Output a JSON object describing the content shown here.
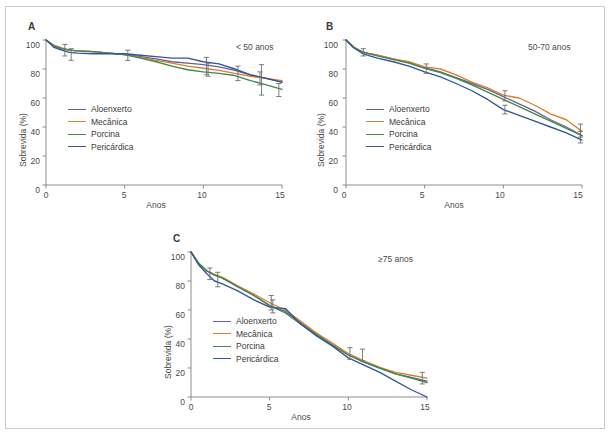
{
  "figure": {
    "panels": [
      {
        "letter": "A",
        "subtitle": "< 50 anos",
        "xlabel": "Anos",
        "ylabel": "Sobrevida (%)"
      },
      {
        "letter": "B",
        "subtitle": "50-70 anos",
        "xlabel": "Anos",
        "ylabel": "Sobrevida (%)"
      },
      {
        "letter": "C",
        "subtitle": "≥75 anos",
        "xlabel": "Anos",
        "ylabel": "Sobrevida (%)"
      }
    ],
    "legend_labels": [
      "Aloenxerto",
      "Mecânica",
      "Porcina",
      "Pericárdica"
    ],
    "colors": {
      "aloenxerto": "#6b5f93",
      "mecanica": "#d9802f",
      "porcina": "#3f8a4c",
      "pericardica": "#34549b",
      "axis": "#8d8d8d",
      "error_bar": "#6d6d6d",
      "text": "#3a3a3a",
      "frame": "#c9c9c9"
    },
    "y_ticks": [
      "0",
      "20",
      "40",
      "60",
      "80",
      "100"
    ],
    "x_ticks": [
      "0",
      "5",
      "10",
      "15"
    ]
  },
  "chart_data": [
    {
      "type": "line",
      "panel": "A",
      "title": "< 50 anos",
      "xlabel": "Anos",
      "ylabel": "Sobrevida (%)",
      "xlim": [
        0,
        15
      ],
      "ylim": [
        0,
        100
      ],
      "x_ticks": [
        0,
        5,
        10,
        15
      ],
      "y_ticks": [
        0,
        20,
        40,
        60,
        80,
        100
      ],
      "grid": false,
      "legend_position": "center-left",
      "x": [
        0,
        0.5,
        1,
        1.5,
        2,
        3,
        4,
        5,
        6,
        7,
        8,
        9,
        10,
        11,
        12,
        13,
        14,
        15
      ],
      "series": [
        {
          "name": "Aloenxerto",
          "color": "#6b5f93",
          "values": [
            100,
            96,
            94,
            93,
            92.5,
            92,
            91,
            90,
            88.5,
            87,
            85,
            84,
            83,
            81.5,
            79,
            76,
            73.5,
            71
          ]
        },
        {
          "name": "Mecânica",
          "color": "#d9802f",
          "values": [
            100,
            96.5,
            94.5,
            93,
            92.5,
            92,
            91,
            90,
            88,
            86,
            84,
            82,
            80.5,
            79,
            77,
            75,
            73.5,
            72
          ]
        },
        {
          "name": "Porcina",
          "color": "#3f8a4c",
          "values": [
            100,
            96,
            94,
            93,
            92.5,
            92,
            91,
            90,
            87.5,
            85,
            82,
            79.5,
            78,
            77,
            75.5,
            72,
            69,
            66
          ]
        },
        {
          "name": "Pericárdica",
          "color": "#34549b",
          "values": [
            100,
            95,
            93,
            91.5,
            91,
            90.5,
            90.5,
            90.5,
            89.5,
            88.5,
            87.5,
            87.5,
            85,
            83.5,
            80,
            76,
            73.5,
            71
          ]
        }
      ],
      "error_bars": [
        {
          "x": 1.2,
          "y": 94,
          "lower": 89,
          "upper": 97
        },
        {
          "x": 1.6,
          "y": 91,
          "lower": 86,
          "upper": 94
        },
        {
          "x": 5.2,
          "y": 90,
          "lower": 86,
          "upper": 93
        },
        {
          "x": 10.2,
          "y": 82,
          "lower": 76,
          "upper": 88
        },
        {
          "x": 10.3,
          "y": 79,
          "lower": 75,
          "upper": 84
        },
        {
          "x": 12.2,
          "y": 77,
          "lower": 72,
          "upper": 82
        },
        {
          "x": 13.6,
          "y": 73,
          "lower": 69,
          "upper": 78
        },
        {
          "x": 13.7,
          "y": 70,
          "lower": 62,
          "upper": 83
        },
        {
          "x": 14.8,
          "y": 65,
          "lower": 61,
          "upper": 70
        }
      ]
    },
    {
      "type": "line",
      "panel": "B",
      "title": "50-70 anos",
      "xlabel": "Anos",
      "ylabel": "Sobrevida (%)",
      "xlim": [
        0,
        15
      ],
      "ylim": [
        0,
        100
      ],
      "x_ticks": [
        0,
        5,
        10,
        15
      ],
      "y_ticks": [
        0,
        20,
        40,
        60,
        80,
        100
      ],
      "grid": false,
      "legend_position": "center-left",
      "x": [
        0,
        0.5,
        1,
        1.5,
        2,
        3,
        4,
        5,
        6,
        7,
        8,
        9,
        10,
        11,
        12,
        13,
        14,
        15
      ],
      "series": [
        {
          "name": "Aloenxerto",
          "color": "#6b5f93",
          "values": [
            100,
            95,
            92,
            90.5,
            89.5,
            87,
            84.5,
            81,
            78,
            74,
            70,
            66,
            61,
            56,
            51,
            45,
            40,
            34
          ]
        },
        {
          "name": "Mecânica",
          "color": "#d9802f",
          "values": [
            100,
            95,
            92,
            90.5,
            89.5,
            87,
            85,
            81.5,
            80,
            76,
            71,
            67,
            62,
            60,
            55,
            49,
            45,
            37
          ]
        },
        {
          "name": "Porcina",
          "color": "#3f8a4c",
          "values": [
            100,
            95,
            92,
            90.5,
            89,
            86.5,
            84,
            80.5,
            77.5,
            73.5,
            69,
            64,
            59,
            54,
            49,
            44,
            39,
            34
          ]
        },
        {
          "name": "Pericárdica",
          "color": "#34549b",
          "values": [
            100,
            94.5,
            91,
            89,
            87.5,
            85,
            82,
            78,
            74.5,
            70,
            65,
            59,
            52,
            48,
            44,
            40,
            36,
            31
          ]
        }
      ],
      "error_bars": [
        {
          "x": 1.1,
          "y": 91.5,
          "lower": 89,
          "upper": 94
        },
        {
          "x": 5.1,
          "y": 80.5,
          "lower": 77,
          "upper": 83.5
        },
        {
          "x": 10.1,
          "y": 61.5,
          "lower": 58,
          "upper": 65
        },
        {
          "x": 10.1,
          "y": 52,
          "lower": 49,
          "upper": 55
        },
        {
          "x": 14.9,
          "y": 37,
          "lower": 33,
          "upper": 42
        },
        {
          "x": 14.9,
          "y": 33,
          "lower": 29,
          "upper": 37
        }
      ]
    },
    {
      "type": "line",
      "panel": "C",
      "title": "≥75 anos",
      "xlabel": "Anos",
      "ylabel": "Sobrevida (%)",
      "xlim": [
        0,
        15
      ],
      "ylim": [
        0,
        100
      ],
      "x_ticks": [
        0,
        5,
        10,
        15
      ],
      "y_ticks": [
        0,
        20,
        40,
        60,
        80,
        100
      ],
      "grid": false,
      "legend_position": "center-left",
      "x": [
        0,
        0.5,
        1,
        1.5,
        2,
        3,
        4,
        5,
        6,
        7,
        8,
        9,
        10,
        11,
        12,
        13,
        14,
        15
      ],
      "series": [
        {
          "name": "Aloenxerto",
          "color": "#6b5f93",
          "values": [
            100,
            92,
            87,
            84,
            82,
            76,
            70,
            63,
            59,
            51,
            43,
            36,
            29,
            24,
            20,
            16,
            13.5,
            11
          ]
        },
        {
          "name": "Mecânica",
          "color": "#d9802f",
          "values": [
            100,
            92,
            87,
            84.5,
            82.5,
            76.5,
            71,
            65,
            60,
            52,
            44,
            37,
            30,
            25,
            20.5,
            17,
            15,
            13
          ]
        },
        {
          "name": "Porcina",
          "color": "#3f8a4c",
          "values": [
            100,
            92,
            87,
            84,
            82,
            76,
            70,
            63,
            58,
            50,
            43,
            35.5,
            29,
            24,
            20,
            16,
            13,
            10
          ]
        },
        {
          "name": "Pericárdica",
          "color": "#34549b",
          "values": [
            100,
            91,
            85,
            80,
            78,
            73,
            67,
            62,
            61,
            50,
            42,
            35,
            27,
            22,
            17,
            11,
            5,
            0
          ]
        }
      ],
      "error_bars": [
        {
          "x": 1.2,
          "y": 85,
          "lower": 81,
          "upper": 89
        },
        {
          "x": 1.7,
          "y": 81,
          "lower": 76,
          "upper": 86
        },
        {
          "x": 5.1,
          "y": 65,
          "lower": 60,
          "upper": 70
        },
        {
          "x": 5.2,
          "y": 62.5,
          "lower": 58,
          "upper": 67
        },
        {
          "x": 10.1,
          "y": 30,
          "lower": 26,
          "upper": 34
        },
        {
          "x": 10.9,
          "y": 29,
          "lower": 25,
          "upper": 33
        },
        {
          "x": 14.7,
          "y": 12.5,
          "lower": 9,
          "upper": 17
        }
      ]
    }
  ]
}
